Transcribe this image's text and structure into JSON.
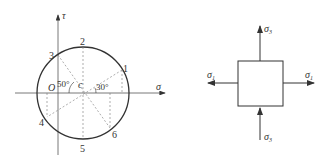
{
  "mohr_circle": {
    "axes": {
      "horizontal": "σ",
      "vertical": "τ"
    },
    "origin_label": "O",
    "center_label": "c",
    "angle_labels": [
      "50°",
      "30°"
    ],
    "points": [
      {
        "id": "1",
        "label": "1"
      },
      {
        "id": "2",
        "label": "2"
      },
      {
        "id": "3",
        "label": "3"
      },
      {
        "id": "4",
        "label": "4"
      },
      {
        "id": "5",
        "label": "5"
      },
      {
        "id": "6",
        "label": "6"
      }
    ]
  },
  "stress_element": {
    "top": {
      "symbol": "σ",
      "subscript": "3"
    },
    "bottom": {
      "symbol": "σ",
      "subscript": "3"
    },
    "left": {
      "symbol": "σ",
      "subscript": "1"
    },
    "right": {
      "symbol": "σ",
      "subscript": "1"
    }
  },
  "colors": {
    "stroke": "#333333",
    "dashed": "#666666"
  }
}
